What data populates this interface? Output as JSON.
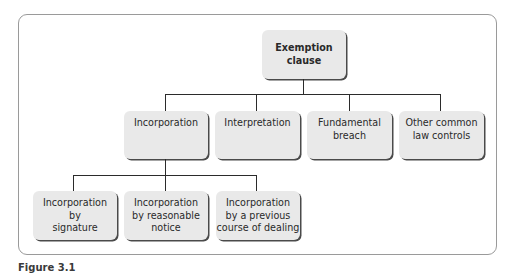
{
  "diagram": {
    "type": "hierarchy-tree",
    "root": {
      "label": "Exemption\nclause"
    },
    "level2": [
      {
        "label": "Incorporation"
      },
      {
        "label": "Interpretation"
      },
      {
        "label": "Fundamental\nbreach"
      },
      {
        "label": "Other common\nlaw controls"
      }
    ],
    "level3": [
      {
        "label": "Incorporation\nby\nsignature"
      },
      {
        "label": "Incorporation\nby reasonable\nnotice"
      },
      {
        "label": "Incorporation\nby a previous\ncourse of dealing"
      }
    ],
    "edges": [
      [
        "Exemption clause",
        "Incorporation"
      ],
      [
        "Exemption clause",
        "Interpretation"
      ],
      [
        "Exemption clause",
        "Fundamental breach"
      ],
      [
        "Exemption clause",
        "Other common law controls"
      ],
      [
        "Incorporation",
        "Incorporation by signature"
      ],
      [
        "Incorporation",
        "Incorporation by reasonable notice"
      ],
      [
        "Incorporation",
        "Incorporation by a previous course of dealing"
      ]
    ]
  },
  "caption": "Figure 3.1",
  "colors": {
    "node_fill": "#e9e9e9",
    "node_shadow": "#4a4a4a",
    "connector": "#2b2b2b",
    "frame": "#9a9a9a"
  }
}
